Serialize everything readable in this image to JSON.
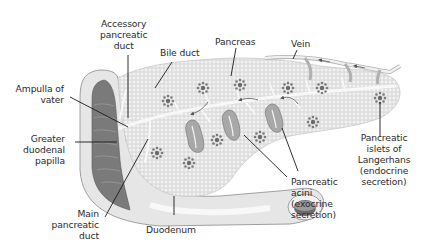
{
  "diagram": {
    "colors": {
      "tissue": "#e3e3e3",
      "tissue_dot": "#f4f4f4",
      "islet": "#6e6e6e",
      "duct": "#f7f7f7",
      "duodenum_inner": "#7a7a7a",
      "duodenum_wall": "#d2d2d2",
      "leader_line": "#1a1a1a"
    },
    "labels": {
      "accessory_duct": "Accessory\npancreatic\nduct",
      "bile_duct": "Bile duct",
      "pancreas": "Pancreas",
      "vein": "Vein",
      "ampulla": "Ampulla of\nvater",
      "greater_papilla": "Greater\nduodenal\npapilla",
      "main_duct": "Main\npancreatic\nduct",
      "duodenum": "Duodenum",
      "acini": "Pancreatic\nacini\n(exocrine\nsecretion)",
      "islets": "Pancreatic\nislets of\nLangerhans\n(endocrine\nsecretion)"
    }
  }
}
